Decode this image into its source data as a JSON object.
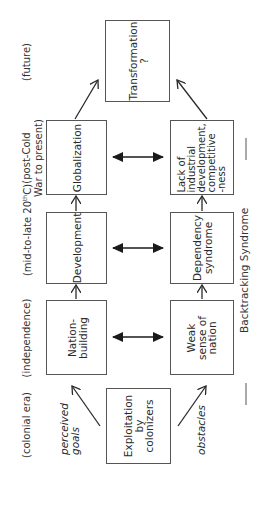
{
  "diagram": {
    "eras": [
      {
        "id": "colonial",
        "label": "(colonial era)"
      },
      {
        "id": "independence",
        "label": "(independence)"
      },
      {
        "id": "mid20",
        "label": "(mid-to-late 20th C)"
      },
      {
        "id": "postcold",
        "label": "(post-Cold\nWar to present)"
      },
      {
        "id": "future",
        "label": "(future)"
      }
    ],
    "origin": {
      "label": "Exploitation\nby\ncolonizers"
    },
    "goals": [
      {
        "label": "Nation-\nbuilding"
      },
      {
        "label": "Development"
      },
      {
        "label": "Globalization"
      }
    ],
    "obstacles": [
      {
        "label": "Weak\nsense of\nnation"
      },
      {
        "label": "Dependency\nsyndrome"
      },
      {
        "label": "Lack of\nindustrial\ndevelopment,\ncompetitive\n-ness"
      }
    ],
    "future": {
      "label": "Transformation\n?"
    },
    "branch_labels": {
      "goals": "perceived\ngoals",
      "obstacles": "obstacles"
    },
    "side_label": "Backtracking Syndrome",
    "line_color": "#2a2a2a"
  }
}
